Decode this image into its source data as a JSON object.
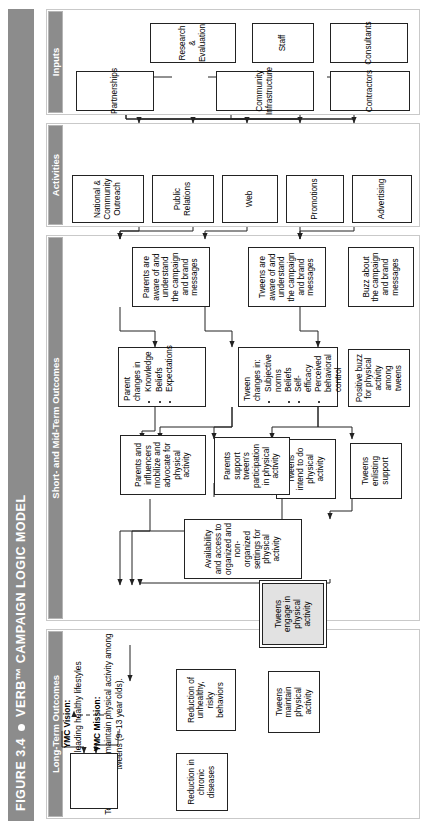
{
  "figure": {
    "number": "FIGURE 3.4",
    "title": "VERB™ CAMPAIGN LOGIC MODEL"
  },
  "columns": [
    {
      "id": "inputs",
      "label": "Inputs"
    },
    {
      "id": "activities",
      "label": "Activities"
    },
    {
      "id": "short_mid",
      "label": "Short- and Mid-Term Outcomes"
    },
    {
      "id": "long_term",
      "label": "Long-Term Outcomes"
    }
  ],
  "vision": {
    "vision_head": "YMC Vision:",
    "vision_text": "All youth leading healthy lifestyles",
    "mission_head": "YMC Mission:",
    "mission_text": "To increase and maintain physical activity among tweens (9–13 year olds)."
  },
  "nodes": {
    "contractors": "Contractors",
    "consultants": "Consultants",
    "staff": "Staff",
    "community_infrastructure": "Community Infrastructure",
    "research_evaluation": "Research & Evaluation",
    "partnerships": "Partnerships",
    "advertising": "Advertising",
    "promotions": "Promotions",
    "web": "Web",
    "public_relations": "Public Relations",
    "national_community_outreach": "National & Community Outreach",
    "buzz_brand": "Buzz about the campaign and brand messages",
    "tweens_aware": "Tweens are aware of and understand the campaign and brand messages",
    "parents_aware": "Parents are aware of and understand the campaign and brand messages",
    "tween_changes_head": "Tween changes in:",
    "tween_changes_items": [
      "Subjective norms",
      "Beliefs",
      "Self-efficacy",
      "Perceived behavioral control"
    ],
    "parent_changes_head": "Parent changes in",
    "parent_changes_items": [
      "Knowledge",
      "Beliefs",
      "Expectations"
    ],
    "positive_buzz": "Positive buzz for physical activity among tweens",
    "tweens_enlisting": "Tweens enlisting support",
    "tweens_intend": "Tweens intend to do physical activity",
    "parents_support": "Parents support tween's participation in physical activity",
    "parents_mobilize": "Parents and influencers mobilize and advocate for physical activity",
    "availability_access": "Availability and access to organized and non-organized settings for physical activity",
    "tweens_engage": "Tweens engage in physical activity",
    "tweens_maintain": "Tweens maintain physical activity",
    "reduction_chronic": "Reduction in chronic diseases",
    "reduction_risky": "Reduction of unhealthy, risky behaviors"
  },
  "colors": {
    "header_gray": "#8c8c8c",
    "highlight_fill": "#e2e2e2",
    "line": "#222222"
  }
}
